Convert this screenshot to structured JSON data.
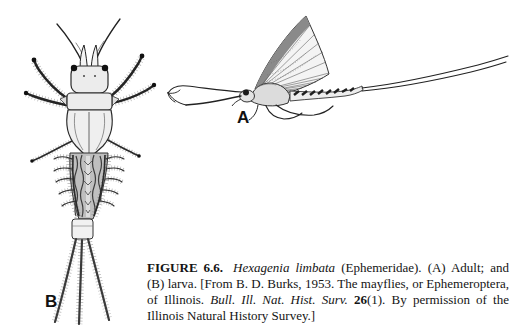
{
  "page": {
    "background_color": "#ffffff",
    "ink_color": "#1a1a1a",
    "kind": "scanned textbook figure"
  },
  "figure": {
    "panel_labels": {
      "adult": "A",
      "larva": "B"
    },
    "illustrations": {
      "adult": "adult-mayfly-lateral-view-line-drawing",
      "larva": "mayfly-larva-dorsal-view-line-drawing"
    }
  },
  "caption": {
    "segments": [
      {
        "style": "bold",
        "text": "FIGURE 6.6."
      },
      {
        "style": "italic",
        "text": "Hexagenia limbata"
      },
      {
        "style": "normal",
        "text": " (Ephemeridae). (A) Adult; and (B) larva. [From B. D. Burks, 1953. The mayflies, or Ephemeroptera, of Illinois. "
      },
      {
        "style": "italic",
        "text": "Bull. Ill. Nat. Hist. Surv. "
      },
      {
        "style": "bold",
        "text": "26"
      },
      {
        "style": "normal",
        "text": "(1). By permission of the Illinois Natural History Survey.]"
      }
    ]
  }
}
